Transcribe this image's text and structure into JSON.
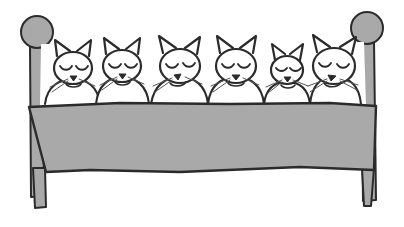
{
  "scene": {
    "title": "Six cats sleeping in a bed",
    "medium": "hand-drawn pen and ink line illustration with flat gray wash",
    "background_color": "#ffffff",
    "width": 404,
    "height": 227
  },
  "palette": {
    "ink": "#2b2b2b",
    "wood_gray": "#a9a9a9",
    "blanket_gray": "#a9a9a9",
    "sheet_white": "#ffffff",
    "whisker_gray": "#555555",
    "background": "#ffffff"
  },
  "bed": {
    "name": "bed",
    "blanket_label": "gray blanket",
    "sheet_label": "white sheet",
    "left_post_label": "left bedpost with round finial",
    "right_post_label": "right bedpost with round finial",
    "left_leg_label": "left bed leg",
    "right_leg_label": "right bed leg",
    "finial_shape": "circle",
    "blanket_top_y": 103,
    "blanket_bottom_y": 172
  },
  "cats": [
    {
      "index": 1,
      "label": "cat-1",
      "position": "leftmost",
      "size": "medium",
      "state": "asleep",
      "eyes": "closed",
      "head_tilt": "upright",
      "cx": 73,
      "cy": 68,
      "rx": 19,
      "ry": 16
    },
    {
      "index": 2,
      "label": "cat-2",
      "position": "second from left",
      "size": "medium",
      "state": "asleep",
      "eyes": "closed",
      "head_tilt": "upright",
      "cx": 122,
      "cy": 66,
      "rx": 19,
      "ry": 16
    },
    {
      "index": 3,
      "label": "cat-3",
      "position": "third from left",
      "size": "medium-large",
      "state": "asleep",
      "eyes": "closed",
      "head_tilt": "tilted left",
      "cx": 180,
      "cy": 66,
      "rx": 20,
      "ry": 17
    },
    {
      "index": 4,
      "label": "cat-4",
      "position": "fourth from left",
      "size": "medium-large",
      "state": "asleep",
      "eyes": "closed",
      "head_tilt": "upright",
      "cx": 236,
      "cy": 66,
      "rx": 20,
      "ry": 17
    },
    {
      "index": 5,
      "label": "cat-5",
      "position": "fifth from left",
      "size": "small",
      "state": "asleep",
      "eyes": "closed",
      "head_tilt": "upright",
      "cx": 287,
      "cy": 70,
      "rx": 16,
      "ry": 14
    },
    {
      "index": 6,
      "label": "cat-6",
      "position": "rightmost",
      "size": "large",
      "state": "asleep",
      "eyes": "closed",
      "head_tilt": "tilted right",
      "cx": 334,
      "cy": 66,
      "rx": 21,
      "ry": 18
    }
  ],
  "counts": {
    "cat_count": 6,
    "bedpost_count": 2,
    "bed_leg_count": 2
  }
}
